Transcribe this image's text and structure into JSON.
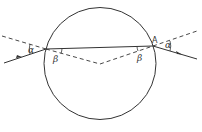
{
  "diagram": {
    "labels": {
      "alpha_left": "α",
      "beta_left": "β",
      "beta_right": "β",
      "alpha_right": "α",
      "point_a": "A"
    },
    "colors": {
      "stroke": "#333333",
      "background": "#ffffff"
    }
  }
}
